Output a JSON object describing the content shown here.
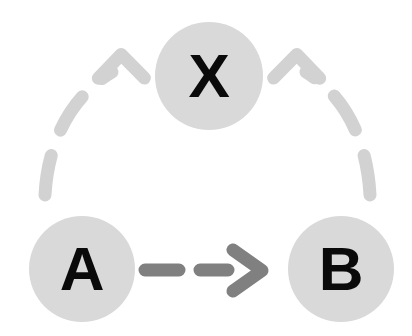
{
  "diagram": {
    "type": "causal-dag",
    "background_color": "#ffffff",
    "canvas": {
      "width": 412,
      "height": 336
    },
    "palette": {
      "node_fill": "#d9d9d9",
      "node_label_color": "#0a0a0a",
      "strong_edge_color": "#808080",
      "weak_edge_color": "#d2d2d2"
    },
    "nodes": [
      {
        "id": "x",
        "label": "X",
        "cx": 209,
        "cy": 76,
        "r": 54,
        "fill": "#d9d9d9",
        "label_color": "#0a0a0a"
      },
      {
        "id": "a",
        "label": "A",
        "cx": 82,
        "cy": 269,
        "r": 53,
        "fill": "#d9d9d9",
        "label_color": "#0a0a0a"
      },
      {
        "id": "b",
        "label": "B",
        "cx": 341,
        "cy": 269,
        "r": 53,
        "fill": "#d9d9d9",
        "label_color": "#0a0a0a"
      }
    ],
    "edges": [
      {
        "id": "a-to-b",
        "from": "A",
        "to": "B",
        "style": "dashed",
        "shape": "straight",
        "color": "#808080",
        "emphasis": "strong",
        "arrowhead": "right"
      },
      {
        "id": "a-to-x",
        "from": "A",
        "to": "X",
        "style": "dashed",
        "shape": "curved",
        "color": "#d2d2d2",
        "emphasis": "weak",
        "arrowhead": "up-right"
      },
      {
        "id": "b-to-x",
        "from": "B",
        "to": "X",
        "style": "dashed",
        "shape": "curved",
        "color": "#d2d2d2",
        "emphasis": "weak",
        "arrowhead": "up-left"
      }
    ]
  }
}
